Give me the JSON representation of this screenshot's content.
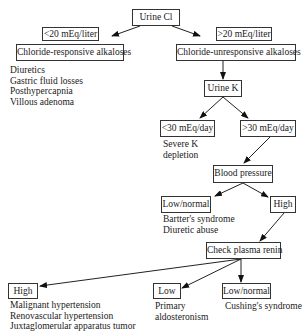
{
  "diagram": {
    "root": "Urine Cl",
    "left_branch": {
      "condition": "<20 mEq/liter",
      "result": "Chloride-responsive alkaloses",
      "causes": [
        "Diuretics",
        "Gastric fluid losses",
        "Posthypercapnia",
        "Villous adenoma"
      ]
    },
    "right_branch": {
      "condition": ">20 mEq/liter",
      "result": "Chloride-unresponsive alkaloses",
      "next": "Urine K",
      "urine_k": {
        "low": {
          "condition": "<30 mEq/day",
          "note": [
            "Severe K",
            "depletion"
          ]
        },
        "high": {
          "condition": ">30 mEq/day",
          "next": "Blood pressure"
        }
      },
      "blood_pressure": {
        "low_normal": {
          "label": "Low/normal",
          "causes": [
            "Bartter's syndrome",
            "Diuretic abuse"
          ]
        },
        "high": {
          "label": "High",
          "next": "Check plasma renin"
        }
      },
      "renin": {
        "high": {
          "label": "High",
          "causes": [
            "Malignant hypertension",
            "Renovascular hypertension",
            "Juxtaglomerular apparatus tumor"
          ]
        },
        "low": {
          "label": "Low",
          "causes": [
            "Primary",
            "aldosteronism"
          ]
        },
        "low_normal": {
          "label": "Low/normal",
          "causes": [
            "Cushing's syndrome"
          ]
        }
      }
    }
  }
}
